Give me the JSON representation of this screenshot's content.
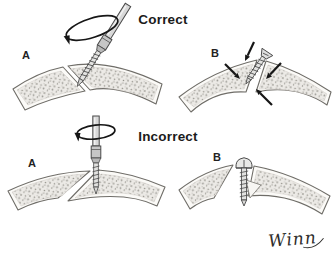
{
  "figure": {
    "top_section": {
      "title": "Correct",
      "left_panel_label": "A",
      "right_panel_label": "B"
    },
    "bottom_section": {
      "title": "Incorrect",
      "left_panel_label": "A",
      "right_panel_label": "B"
    },
    "signature": "Winn"
  },
  "colors": {
    "background": "#ffffff",
    "outline": "#6f6d68",
    "ink": "#1b1b1b",
    "bone_fill": "#eceae6",
    "stipple": "#98968f",
    "metal": "#d8d8d8"
  }
}
